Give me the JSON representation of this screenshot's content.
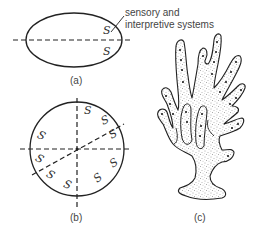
{
  "figure": {
    "panels": [
      {
        "id": "a",
        "caption": "(a)",
        "shape": "ellipse",
        "axes": [
          "horizontal"
        ],
        "symbol": "S",
        "symbol_count": 2
      },
      {
        "id": "b",
        "caption": "(b)",
        "shape": "circle",
        "axes": [
          "horizontal",
          "vertical",
          "oblique"
        ],
        "symbol": "S",
        "symbol_count": 10
      },
      {
        "id": "c",
        "caption": "(c)",
        "shape": "branching-coral",
        "axes": []
      }
    ],
    "annotation": {
      "line1": "sensory and",
      "line2": "interpretive systems"
    },
    "symbol_label": "S",
    "colors": {
      "stroke": "#222222",
      "stipple": "#555555",
      "text": "#444444",
      "background": "#ffffff"
    }
  }
}
